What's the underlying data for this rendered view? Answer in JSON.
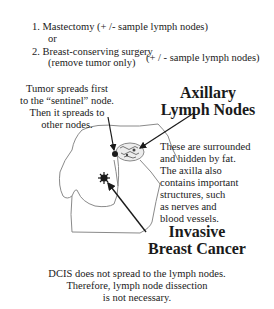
{
  "treatment_options": {
    "option1": "1. Mastectomy (+ /- sample lymph nodes)",
    "or": "or",
    "option2": "2. Breast-conserving surgery",
    "option2_detail": "(remove tumor only)",
    "option2_nodes": "(+ / - sample lymph nodes)"
  },
  "sentinel_note": {
    "lines": [
      "Tumor spreads first",
      "to the “sentinel” node.",
      "Then it spreads to",
      "other nodes."
    ]
  },
  "axillary_label": {
    "line1": "Axillary",
    "line2": "Lymph Nodes"
  },
  "fat_note": {
    "lines": [
      "These are surrounded",
      " and hidden by fat.",
      "The axilla also",
      "contains important",
      "structures, such",
      "as nerves and",
      "blood vessels."
    ]
  },
  "cancer_label": {
    "line1": "Invasive",
    "line2": "Breast Cancer"
  },
  "dcis_note": {
    "lines": [
      "DCIS does not spread to the lymph nodes.",
      "Therefore, lymph node dissection",
      "is not necessary."
    ]
  },
  "colors": {
    "text": "#1a1a1a",
    "outline": "#8a8a8a",
    "arrow": "#1a1a1a",
    "node_fill": "#e6e6e6"
  }
}
